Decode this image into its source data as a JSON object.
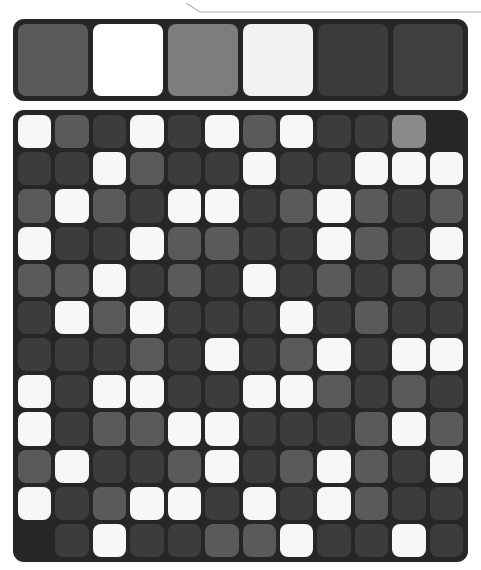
{
  "panel": {
    "background_color": "#262626",
    "corner_radius": "11px"
  },
  "top_divider": {
    "name": "panel-edge-line",
    "color": "#b0b0b0"
  },
  "colors": {
    "white": "#f7f7f7",
    "off_white": "#f2f2f2",
    "light_gray": "#8a8a8a",
    "mid_gray": "#5a5a5a",
    "dark_gray": "#3c3c3c",
    "panel_dark": "#262626"
  },
  "palette": {
    "label": "color-palette",
    "swatch_count": 6,
    "swatches": [
      {
        "index": 0,
        "name": "swatch-mid-gray",
        "color": "#5a5a5a"
      },
      {
        "index": 1,
        "name": "swatch-white",
        "color": "#ffffff"
      },
      {
        "index": 2,
        "name": "swatch-light-gray",
        "color": "#7d7d7d"
      },
      {
        "index": 3,
        "name": "swatch-off-white",
        "color": "#f2f2f2"
      },
      {
        "index": 4,
        "name": "swatch-dark-gray",
        "color": "#3c3c3c"
      },
      {
        "index": 5,
        "name": "swatch-dark-gray-2",
        "color": "#3f3f3f"
      }
    ]
  },
  "grid": {
    "label": "color-cell-grid",
    "columns": 12,
    "rows": 12,
    "cell_radius": "8px",
    "gap": "4px",
    "legend": {
      "W": "#f7f7f7",
      "L": "#8a8a8a",
      "M": "#5a5a5a",
      "D": "#3c3c3c",
      "E": "transparent"
    },
    "cells": [
      [
        "W",
        "M",
        "D",
        "W",
        "D",
        "W",
        "M",
        "W",
        "D",
        "D",
        "L",
        "E"
      ],
      [
        "D",
        "D",
        "W",
        "M",
        "D",
        "D",
        "W",
        "D",
        "D",
        "W",
        "W",
        "W"
      ],
      [
        "M",
        "W",
        "M",
        "D",
        "W",
        "W",
        "D",
        "M",
        "W",
        "M",
        "D",
        "M"
      ],
      [
        "W",
        "D",
        "D",
        "W",
        "M",
        "M",
        "D",
        "D",
        "W",
        "M",
        "D",
        "W"
      ],
      [
        "M",
        "M",
        "W",
        "D",
        "M",
        "D",
        "W",
        "D",
        "M",
        "D",
        "M",
        "M"
      ],
      [
        "D",
        "W",
        "M",
        "W",
        "D",
        "D",
        "D",
        "W",
        "D",
        "M",
        "D",
        "D"
      ],
      [
        "D",
        "D",
        "D",
        "M",
        "D",
        "W",
        "D",
        "M",
        "W",
        "D",
        "W",
        "W"
      ],
      [
        "W",
        "D",
        "W",
        "W",
        "D",
        "D",
        "W",
        "W",
        "M",
        "D",
        "M",
        "D"
      ],
      [
        "W",
        "D",
        "M",
        "M",
        "W",
        "W",
        "D",
        "D",
        "D",
        "M",
        "W",
        "M"
      ],
      [
        "M",
        "W",
        "D",
        "D",
        "M",
        "W",
        "D",
        "M",
        "W",
        "M",
        "D",
        "W"
      ],
      [
        "W",
        "D",
        "M",
        "W",
        "W",
        "D",
        "W",
        "D",
        "W",
        "M",
        "D",
        "D"
      ],
      [
        "E",
        "D",
        "W",
        "D",
        "D",
        "M",
        "M",
        "W",
        "D",
        "D",
        "W",
        "D"
      ]
    ]
  }
}
